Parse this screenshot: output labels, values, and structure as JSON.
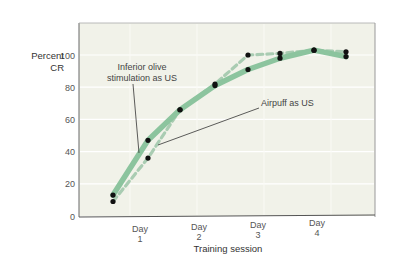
{
  "chart_data": {
    "type": "line",
    "title": "",
    "xlabel": "Training session",
    "ylabel": [
      "Percent",
      "CR"
    ],
    "ylim": [
      0,
      100
    ],
    "yticks": [
      0,
      20,
      40,
      60,
      80,
      100
    ],
    "grid": true,
    "legend": "none (direct annotations)",
    "x_tick_labels": [
      {
        "line1": "Day",
        "line2": "1",
        "pos": 1.5
      },
      {
        "line1": "Day",
        "line2": "2",
        "pos": 3.5
      },
      {
        "line1": "Day",
        "line2": "3",
        "pos": 5.5
      },
      {
        "line1": "Day",
        "line2": "4",
        "pos": 7.5
      }
    ],
    "x": [
      1,
      2,
      3,
      4,
      5,
      6,
      7,
      8
    ],
    "series": [
      {
        "name": "Inferior olive stimulation as US",
        "style": "solid",
        "color": "#8cc49e",
        "values": [
          13,
          47,
          66,
          81,
          91,
          98,
          103,
          99
        ]
      },
      {
        "name": "Airpuff as US",
        "style": "dashed",
        "color": "#a9ccb2",
        "values": [
          9,
          36,
          66,
          82,
          100,
          101,
          103,
          102
        ]
      }
    ],
    "annotations": [
      {
        "text_lines": [
          "Inferior olive",
          "stimulation as US"
        ],
        "target_series": 0
      },
      {
        "text_lines": [
          "Airpuff as US"
        ],
        "target_series": 1
      }
    ]
  },
  "colors": {
    "plot_bg": "#f1f2e9",
    "grid": "#ffffff",
    "axis": "#555555",
    "marker": "#111111"
  }
}
